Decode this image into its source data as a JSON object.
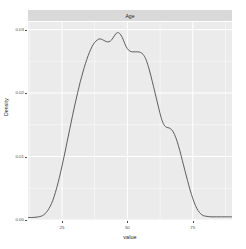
{
  "chart_data": {
    "type": "line",
    "title": "",
    "facet_label": "Age",
    "xlabel": "value",
    "ylabel": "Density",
    "xlim": [
      12,
      90
    ],
    "ylim": [
      0,
      0.0312
    ],
    "grid": true,
    "legend": false,
    "x_ticks": [
      25,
      50,
      75
    ],
    "x_tick_labels": [
      "25",
      "50",
      "75"
    ],
    "y_ticks": [
      0.0,
      0.01,
      0.02,
      0.03
    ],
    "y_tick_labels": [
      "0.00",
      "0.01",
      "0.02",
      "0.03"
    ],
    "line_color": "#4d4d4d",
    "panel_color": "#ebebeb",
    "grid_color": "#ffffff",
    "strip_color": "#d9d9d9",
    "series": [
      {
        "name": "Age",
        "x": [
          12,
          14,
          16,
          17,
          18,
          19,
          20,
          21,
          22,
          23,
          24,
          25,
          26,
          27,
          28,
          29,
          30,
          31,
          32,
          33,
          34,
          35,
          36,
          37,
          38,
          39,
          40,
          41,
          42,
          43,
          44,
          45,
          46,
          47,
          48,
          49,
          50,
          51,
          52,
          53,
          54,
          55,
          56,
          57,
          58,
          59,
          60,
          61,
          62,
          63,
          64,
          65,
          66,
          67,
          68,
          69,
          70,
          71,
          72,
          73,
          74,
          75,
          76,
          77,
          78,
          79,
          80,
          82,
          84,
          86,
          88,
          90
        ],
        "values": [
          0.0004,
          0.0004,
          0.0005,
          0.0006,
          0.0008,
          0.0012,
          0.0018,
          0.0026,
          0.0037,
          0.0051,
          0.0067,
          0.0085,
          0.0104,
          0.0124,
          0.0144,
          0.0164,
          0.0183,
          0.0201,
          0.0218,
          0.0233,
          0.0247,
          0.0259,
          0.0269,
          0.0277,
          0.0282,
          0.0285,
          0.0285,
          0.0283,
          0.0281,
          0.0281,
          0.0284,
          0.029,
          0.0295,
          0.0294,
          0.0288,
          0.0278,
          0.027,
          0.0266,
          0.0265,
          0.0265,
          0.0265,
          0.0264,
          0.0261,
          0.0254,
          0.0242,
          0.0227,
          0.021,
          0.0193,
          0.0176,
          0.016,
          0.015,
          0.0146,
          0.0145,
          0.0142,
          0.0135,
          0.0124,
          0.011,
          0.0094,
          0.0078,
          0.0062,
          0.0047,
          0.0034,
          0.0023,
          0.0015,
          0.001,
          0.0007,
          0.0006,
          0.0005,
          0.0005,
          0.0005,
          0.0005,
          0.0005
        ]
      }
    ]
  }
}
